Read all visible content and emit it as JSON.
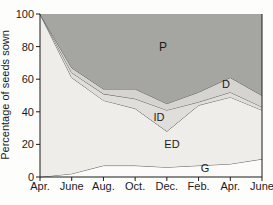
{
  "chart_data": {
    "type": "area",
    "title": "",
    "xlabel": "",
    "ylabel": "Percentage of seeds sown",
    "x_categories": [
      "Apr.",
      "June",
      "Aug.",
      "Oct.",
      "Dec.",
      "Feb.",
      "Apr.",
      "June"
    ],
    "y_ticks": [
      0,
      20,
      40,
      60,
      80,
      100
    ],
    "ylim": [
      0,
      100
    ],
    "grid": false,
    "legend": "none",
    "stacking_note": "stacked area of seed fates; each series lists its TOP boundary (% of seeds sown) at each x tick, stacked bottom-to-top: G, ED, ID, D, P",
    "series": [
      {
        "name": "G",
        "boundary_top": [
          0,
          2,
          7,
          7,
          6,
          7,
          8,
          11
        ],
        "fill": "#fcfbf9",
        "stroke_top": true,
        "label": {
          "text": "G",
          "x": 205,
          "y": 172,
          "size": 11
        }
      },
      {
        "name": "ED",
        "boundary_top": [
          100,
          61,
          47,
          42,
          28,
          44,
          49,
          41
        ],
        "fill": "#efede9",
        "stroke_top": true,
        "label": {
          "text": "ED",
          "x": 172,
          "y": 148,
          "size": 11
        }
      },
      {
        "name": "ID",
        "boundary_top": [
          100,
          64,
          51,
          48,
          41,
          46,
          52,
          43
        ],
        "fill": "#e0deda",
        "stroke_top": true,
        "label": {
          "text": "ID",
          "x": 159,
          "y": 121,
          "size": 11
        }
      },
      {
        "name": "D",
        "boundary_top": [
          100,
          67,
          54,
          54,
          45,
          52,
          61,
          50
        ],
        "fill": "#d5d4d0",
        "stroke_top": true,
        "label": {
          "text": "D",
          "x": 226,
          "y": 88,
          "size": 11
        }
      },
      {
        "name": "P",
        "boundary_top": [
          100,
          100,
          100,
          100,
          100,
          100,
          100,
          100
        ],
        "fill": "#a5a5a2",
        "stroke_top": false,
        "label": {
          "text": "P",
          "x": 163,
          "y": 51,
          "size": 12
        }
      }
    ],
    "colors": {
      "line": "#5d5d5b",
      "axis": "#1b1b1b",
      "text": "#1b1b1b"
    },
    "layout": {
      "width": 273,
      "height": 205,
      "plot_left": 40,
      "plot_right": 262,
      "plot_top": 14,
      "plot_bottom": 177,
      "tick_len": 4,
      "x_label_y": 190,
      "y_label_x": 34,
      "ylabel_x": 9,
      "ylabel_y": 95,
      "tick_font": 11,
      "ylabel_font": 11
    }
  }
}
